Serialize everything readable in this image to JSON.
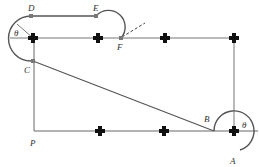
{
  "diagram": {
    "labels": {
      "D": "D",
      "E": "E",
      "F": "F",
      "C": "C",
      "P": "P",
      "B": "B",
      "A": "A",
      "theta_left": "θ",
      "theta_right": "θ"
    },
    "colors": {
      "line": "#555555",
      "cross": "#111111",
      "marker": "#777777"
    }
  }
}
